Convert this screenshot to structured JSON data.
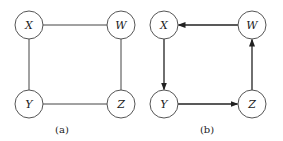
{
  "diagrams": [
    {
      "id": "a",
      "caption": "(a)",
      "type": "undirected",
      "nodes": [
        {
          "id": "X",
          "label": "X"
        },
        {
          "id": "W",
          "label": "W"
        },
        {
          "id": "Y",
          "label": "Y"
        },
        {
          "id": "Z",
          "label": "Z"
        }
      ],
      "edges": [
        {
          "from": "X",
          "to": "W",
          "directed": false
        },
        {
          "from": "X",
          "to": "Y",
          "directed": false
        },
        {
          "from": "W",
          "to": "Z",
          "directed": false
        },
        {
          "from": "Y",
          "to": "Z",
          "directed": false
        }
      ]
    },
    {
      "id": "b",
      "caption": "(b)",
      "type": "directed",
      "nodes": [
        {
          "id": "X",
          "label": "X"
        },
        {
          "id": "W",
          "label": "W"
        },
        {
          "id": "Y",
          "label": "Y"
        },
        {
          "id": "Z",
          "label": "Z"
        }
      ],
      "edges": [
        {
          "from": "W",
          "to": "X",
          "directed": true
        },
        {
          "from": "X",
          "to": "Y",
          "directed": true
        },
        {
          "from": "Y",
          "to": "Z",
          "directed": true
        },
        {
          "from": "Z",
          "to": "W",
          "directed": true
        }
      ]
    }
  ]
}
